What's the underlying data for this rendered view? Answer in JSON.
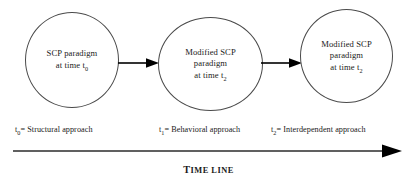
{
  "diagram": {
    "title": "TIME LINE",
    "title_lead": "T",
    "title_rest": "IME LINE",
    "nodes": [
      {
        "id": "node-1",
        "text_line1": "SCP paradigm",
        "text_line2": "at time t",
        "subscript": "0",
        "full_text": "SCP paradigm at time t0"
      },
      {
        "id": "node-2",
        "text_line1": "Modified SCP",
        "text_line2": "paradigm",
        "text_line3": "at time t",
        "subscript": "2",
        "full_text": "Modified SCP paradigm at time t2"
      },
      {
        "id": "node-3",
        "text_line1": "Modified SCP",
        "text_line2": "paradigm",
        "text_line3": "at time t",
        "subscript": "2",
        "full_text": "Modified SCP paradigm at time t2"
      }
    ],
    "captions": [
      {
        "symbol": "t",
        "subscript": "0",
        "text": "= Structural approach"
      },
      {
        "symbol": "t",
        "subscript": "1",
        "text": "= Behavioral approach"
      },
      {
        "symbol": "t",
        "subscript": "2",
        "text": "= Interdependent approach"
      }
    ],
    "colors": {
      "circle_stroke": "#4a4a4a",
      "arrow": "#000000",
      "text": "#1a1a1a",
      "background": "#ffffff"
    }
  }
}
